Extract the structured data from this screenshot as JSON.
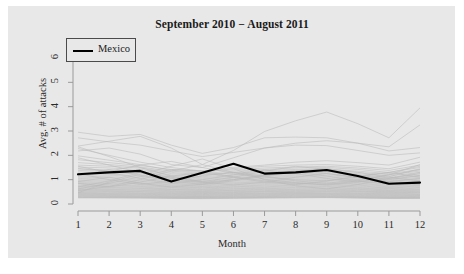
{
  "chart_data": {
    "type": "line",
    "title": "September 2010 − August 2011",
    "xlabel": "Month",
    "ylabel": "Avg. # of attacks",
    "xlim": [
      1,
      12
    ],
    "ylim": [
      0,
      6.4
    ],
    "xticks": [
      "1",
      "2",
      "3",
      "4",
      "5",
      "6",
      "7",
      "8",
      "9",
      "10",
      "11",
      "12"
    ],
    "yticks": [
      "0",
      "1",
      "2",
      "3",
      "4",
      "5",
      "6"
    ],
    "grid": false,
    "legend": {
      "position": "top-left",
      "entries": [
        {
          "name": "Mexico",
          "color": "#000000",
          "linewidth": 2.1
        }
      ]
    },
    "x": [
      1,
      2,
      3,
      4,
      5,
      6,
      7,
      8,
      9,
      10,
      11,
      12
    ],
    "highlight_series": {
      "name": "Mexico",
      "color": "#000000",
      "values": [
        1.22,
        1.3,
        1.36,
        0.92,
        1.28,
        1.65,
        1.25,
        1.3,
        1.4,
        1.15,
        0.83,
        0.88
      ]
    },
    "background_series": [
      {
        "name": "bg-01",
        "values": [
          2.95,
          2.78,
          2.86,
          2.42,
          2.08,
          2.32,
          2.72,
          2.75,
          2.72,
          2.5,
          2.18,
          2.32
        ]
      },
      {
        "name": "bg-02",
        "values": [
          2.72,
          2.55,
          2.42,
          2.18,
          1.95,
          2.12,
          2.3,
          2.42,
          2.4,
          2.2,
          2.0,
          2.1
        ]
      },
      {
        "name": "bg-03",
        "values": [
          2.38,
          2.58,
          2.78,
          2.3,
          1.62,
          2.2,
          2.98,
          3.42,
          3.78,
          3.3,
          2.72,
          3.95
        ]
      },
      {
        "name": "bg-04",
        "values": [
          2.18,
          2.3,
          2.05,
          1.62,
          1.5,
          1.9,
          2.3,
          2.5,
          2.6,
          2.5,
          2.35,
          3.25
        ]
      },
      {
        "name": "bg-05",
        "values": [
          2.28,
          2.0,
          1.72,
          1.5,
          1.35,
          1.5,
          1.6,
          1.72,
          1.78,
          1.7,
          1.6,
          1.92
        ]
      },
      {
        "name": "bg-06",
        "values": [
          1.98,
          1.8,
          1.62,
          1.38,
          1.3,
          1.45,
          1.55,
          1.6,
          1.62,
          1.55,
          1.45,
          1.72
        ]
      },
      {
        "name": "bg-07",
        "values": [
          1.82,
          1.7,
          1.58,
          1.42,
          1.35,
          1.4,
          1.48,
          1.52,
          1.55,
          1.48,
          1.38,
          1.6
        ]
      },
      {
        "name": "bg-08",
        "values": [
          1.7,
          1.62,
          1.52,
          1.35,
          1.25,
          1.35,
          1.42,
          1.48,
          1.5,
          1.42,
          1.3,
          1.5
        ]
      },
      {
        "name": "bg-09",
        "values": [
          1.6,
          1.55,
          1.48,
          1.3,
          1.2,
          1.3,
          1.38,
          1.42,
          1.44,
          1.35,
          1.25,
          1.42
        ]
      },
      {
        "name": "bg-10",
        "values": [
          1.52,
          1.48,
          1.42,
          1.25,
          1.18,
          1.28,
          1.32,
          1.38,
          1.4,
          1.3,
          1.2,
          1.35
        ]
      },
      {
        "name": "bg-11",
        "values": [
          1.45,
          1.4,
          1.35,
          1.2,
          1.12,
          1.22,
          1.28,
          1.32,
          1.34,
          1.25,
          1.15,
          1.3
        ]
      },
      {
        "name": "bg-12",
        "values": [
          1.38,
          1.34,
          1.3,
          1.15,
          1.08,
          1.18,
          1.22,
          1.28,
          1.3,
          1.2,
          1.1,
          1.24
        ]
      },
      {
        "name": "bg-13",
        "values": [
          1.32,
          1.28,
          1.24,
          1.1,
          1.04,
          1.14,
          1.18,
          1.22,
          1.25,
          1.16,
          1.06,
          1.18
        ]
      },
      {
        "name": "bg-14",
        "values": [
          1.26,
          1.22,
          1.18,
          1.06,
          1.0,
          1.1,
          1.14,
          1.18,
          1.2,
          1.12,
          1.02,
          1.14
        ]
      },
      {
        "name": "bg-15",
        "values": [
          1.2,
          1.18,
          1.14,
          1.02,
          0.96,
          1.06,
          1.1,
          1.14,
          1.16,
          1.08,
          0.98,
          1.1
        ]
      },
      {
        "name": "bg-16",
        "values": [
          1.15,
          1.12,
          1.1,
          0.98,
          0.93,
          1.02,
          1.06,
          1.1,
          1.12,
          1.04,
          0.95,
          1.06
        ]
      },
      {
        "name": "bg-17",
        "values": [
          1.1,
          1.08,
          1.05,
          0.95,
          0.9,
          0.98,
          1.02,
          1.06,
          1.08,
          1.0,
          0.92,
          1.02
        ]
      },
      {
        "name": "bg-18",
        "values": [
          1.05,
          1.03,
          1.0,
          0.92,
          0.87,
          0.94,
          0.98,
          1.02,
          1.04,
          0.97,
          0.89,
          0.98
        ]
      },
      {
        "name": "bg-19",
        "values": [
          1.0,
          0.99,
          0.96,
          0.88,
          0.84,
          0.9,
          0.94,
          0.98,
          1.0,
          0.93,
          0.86,
          0.94
        ]
      },
      {
        "name": "bg-20",
        "values": [
          0.96,
          0.95,
          0.92,
          0.85,
          0.81,
          0.87,
          0.9,
          0.94,
          0.96,
          0.9,
          0.83,
          0.9
        ]
      },
      {
        "name": "bg-21",
        "values": [
          0.92,
          0.91,
          0.88,
          0.82,
          0.78,
          0.84,
          0.87,
          0.9,
          0.92,
          0.86,
          0.8,
          0.87
        ]
      },
      {
        "name": "bg-22",
        "values": [
          0.88,
          0.87,
          0.85,
          0.79,
          0.75,
          0.8,
          0.84,
          0.87,
          0.88,
          0.83,
          0.77,
          0.83
        ]
      },
      {
        "name": "bg-23",
        "values": [
          0.85,
          0.84,
          0.82,
          0.76,
          0.72,
          0.77,
          0.8,
          0.84,
          0.85,
          0.8,
          0.74,
          0.8
        ]
      },
      {
        "name": "bg-24",
        "values": [
          0.82,
          0.8,
          0.78,
          0.73,
          0.7,
          0.74,
          0.77,
          0.8,
          0.82,
          0.77,
          0.71,
          0.77
        ]
      },
      {
        "name": "bg-25",
        "values": [
          0.78,
          0.77,
          0.75,
          0.7,
          0.67,
          0.71,
          0.74,
          0.77,
          0.78,
          0.74,
          0.68,
          0.74
        ]
      },
      {
        "name": "bg-26",
        "values": [
          0.75,
          0.74,
          0.72,
          0.68,
          0.65,
          0.69,
          0.71,
          0.74,
          0.75,
          0.71,
          0.66,
          0.71
        ]
      },
      {
        "name": "bg-27",
        "values": [
          0.72,
          0.71,
          0.69,
          0.65,
          0.62,
          0.66,
          0.68,
          0.71,
          0.72,
          0.68,
          0.63,
          0.68
        ]
      },
      {
        "name": "bg-28",
        "values": [
          0.69,
          0.68,
          0.66,
          0.62,
          0.6,
          0.63,
          0.65,
          0.68,
          0.69,
          0.65,
          0.61,
          0.65
        ]
      },
      {
        "name": "bg-29",
        "values": [
          0.66,
          0.65,
          0.64,
          0.6,
          0.58,
          0.61,
          0.63,
          0.65,
          0.66,
          0.63,
          0.58,
          0.62
        ]
      },
      {
        "name": "bg-30",
        "values": [
          0.63,
          0.62,
          0.61,
          0.58,
          0.55,
          0.58,
          0.6,
          0.62,
          0.63,
          0.6,
          0.56,
          0.6
        ]
      },
      {
        "name": "bg-31",
        "values": [
          0.6,
          0.6,
          0.58,
          0.55,
          0.53,
          0.56,
          0.58,
          0.6,
          0.61,
          0.58,
          0.54,
          0.57
        ]
      },
      {
        "name": "bg-32",
        "values": [
          0.58,
          0.57,
          0.56,
          0.53,
          0.51,
          0.54,
          0.55,
          0.57,
          0.58,
          0.55,
          0.52,
          0.55
        ]
      },
      {
        "name": "bg-33",
        "values": [
          0.55,
          0.55,
          0.53,
          0.51,
          0.49,
          0.51,
          0.53,
          0.55,
          0.56,
          0.53,
          0.5,
          0.52
        ]
      },
      {
        "name": "bg-34",
        "values": [
          0.53,
          0.52,
          0.51,
          0.48,
          0.47,
          0.49,
          0.51,
          0.52,
          0.53,
          0.51,
          0.48,
          0.5
        ]
      },
      {
        "name": "bg-35",
        "values": [
          0.5,
          0.5,
          0.49,
          0.46,
          0.45,
          0.47,
          0.49,
          0.5,
          0.51,
          0.49,
          0.46,
          0.48
        ]
      },
      {
        "name": "bg-36",
        "values": [
          0.48,
          0.48,
          0.46,
          0.44,
          0.43,
          0.45,
          0.46,
          0.48,
          0.49,
          0.46,
          0.44,
          0.46
        ]
      },
      {
        "name": "bg-37",
        "values": [
          0.46,
          0.45,
          0.44,
          0.42,
          0.41,
          0.43,
          0.44,
          0.46,
          0.46,
          0.44,
          0.42,
          0.44
        ]
      },
      {
        "name": "bg-38",
        "values": [
          0.44,
          0.43,
          0.42,
          0.4,
          0.39,
          0.41,
          0.42,
          0.44,
          0.44,
          0.42,
          0.4,
          0.41
        ]
      },
      {
        "name": "bg-39",
        "values": [
          0.42,
          0.41,
          0.4,
          0.38,
          0.37,
          0.39,
          0.4,
          0.42,
          0.42,
          0.4,
          0.38,
          0.39
        ]
      },
      {
        "name": "bg-40",
        "values": [
          0.4,
          0.39,
          0.38,
          0.36,
          0.35,
          0.37,
          0.38,
          0.4,
          0.4,
          0.38,
          0.36,
          0.37
        ]
      },
      {
        "name": "bg-41",
        "values": [
          0.38,
          0.37,
          0.36,
          0.34,
          0.33,
          0.35,
          0.36,
          0.38,
          0.38,
          0.36,
          0.34,
          0.35
        ]
      },
      {
        "name": "bg-42",
        "values": [
          0.36,
          0.35,
          0.34,
          0.32,
          0.31,
          0.33,
          0.34,
          0.36,
          0.36,
          0.34,
          0.32,
          0.33
        ]
      },
      {
        "name": "bg-43",
        "values": [
          0.34,
          0.33,
          0.32,
          0.3,
          0.3,
          0.31,
          0.32,
          0.34,
          0.34,
          0.32,
          0.3,
          0.31
        ]
      },
      {
        "name": "bg-44",
        "values": [
          0.32,
          0.31,
          0.3,
          0.29,
          0.28,
          0.29,
          0.3,
          0.32,
          0.32,
          0.3,
          0.28,
          0.29
        ]
      },
      {
        "name": "bg-45",
        "values": [
          0.3,
          0.29,
          0.29,
          0.27,
          0.26,
          0.28,
          0.29,
          0.3,
          0.3,
          0.29,
          0.27,
          0.27
        ]
      },
      {
        "name": "bg-46",
        "values": [
          0.28,
          0.28,
          0.27,
          0.26,
          0.25,
          0.26,
          0.27,
          0.28,
          0.29,
          0.27,
          0.25,
          0.26
        ]
      },
      {
        "name": "bg-47",
        "values": [
          0.27,
          0.26,
          0.26,
          0.24,
          0.24,
          0.25,
          0.26,
          0.27,
          0.27,
          0.26,
          0.24,
          0.24
        ]
      },
      {
        "name": "bg-48",
        "values": [
          0.25,
          0.25,
          0.24,
          0.23,
          0.22,
          0.23,
          0.24,
          0.25,
          0.26,
          0.24,
          0.23,
          0.23
        ]
      },
      {
        "name": "bg-49",
        "values": [
          0.46,
          0.9,
          1.22,
          1.55,
          1.85,
          1.45,
          1.0,
          0.75,
          0.62,
          0.8,
          1.05,
          1.3
        ]
      },
      {
        "name": "bg-50",
        "values": [
          2.35,
          1.95,
          1.5,
          1.15,
          0.92,
          1.1,
          1.35,
          1.55,
          1.42,
          1.2,
          1.0,
          1.18
        ]
      },
      {
        "name": "bg-51",
        "values": [
          0.55,
          0.72,
          1.0,
          1.35,
          1.62,
          1.3,
          1.02,
          0.88,
          0.78,
          0.9,
          1.12,
          1.45
        ]
      },
      {
        "name": "bg-52",
        "values": [
          1.9,
          1.6,
          1.3,
          1.05,
          0.88,
          1.0,
          1.18,
          1.32,
          1.25,
          1.08,
          0.92,
          1.05
        ]
      },
      {
        "name": "bg-53",
        "values": [
          0.62,
          0.85,
          1.12,
          1.42,
          1.35,
          1.12,
          0.95,
          0.85,
          0.8,
          0.95,
          1.2,
          1.62
        ]
      },
      {
        "name": "bg-54",
        "values": [
          1.45,
          1.35,
          1.6,
          1.75,
          1.5,
          1.25,
          1.1,
          1.0,
          0.95,
          1.1,
          1.3,
          1.55
        ]
      },
      {
        "name": "bg-55",
        "values": [
          0.92,
          1.1,
          0.85,
          0.7,
          0.82,
          1.0,
          1.2,
          1.35,
          1.45,
          1.3,
          1.1,
          0.95
        ]
      },
      {
        "name": "bg-56",
        "values": [
          1.25,
          1.0,
          0.8,
          0.95,
          1.15,
          1.3,
          1.15,
          0.95,
          0.85,
          1.0,
          1.2,
          1.4
        ]
      },
      {
        "name": "bg-57",
        "values": [
          0.7,
          0.95,
          1.3,
          1.1,
          0.9,
          0.78,
          0.9,
          1.1,
          1.25,
          1.1,
          0.9,
          0.78
        ]
      },
      {
        "name": "bg-58",
        "values": [
          1.55,
          1.3,
          1.05,
          0.85,
          1.0,
          1.2,
          1.4,
          1.25,
          1.05,
          0.9,
          1.05,
          1.25
        ]
      },
      {
        "name": "bg-59",
        "values": [
          0.85,
          0.7,
          0.9,
          1.15,
          1.3,
          1.1,
          0.9,
          0.8,
          0.95,
          1.15,
          1.3,
          1.1
        ]
      },
      {
        "name": "bg-60",
        "values": [
          1.15,
          1.42,
          1.18,
          0.95,
          0.8,
          0.95,
          1.15,
          1.3,
          1.15,
          0.95,
          0.82,
          0.95
        ]
      }
    ]
  }
}
